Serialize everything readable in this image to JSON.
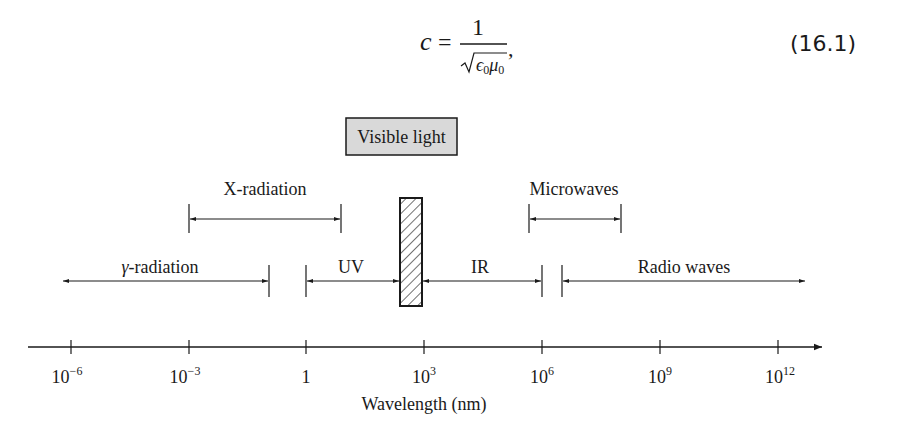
{
  "equation": {
    "lhs": "c",
    "equals": "=",
    "numerator": "1",
    "denominator_symbols": [
      "ϵ",
      "0",
      "μ",
      "0"
    ],
    "trailing": ",",
    "number": "(16.1)"
  },
  "diagram": {
    "visible_light_label": "Visible light",
    "bands": [
      {
        "name": "x-radiation",
        "label": "X-radiation"
      },
      {
        "name": "microwaves",
        "label": "Microwaves"
      },
      {
        "name": "gamma-radiation",
        "label_symbol": "γ",
        "label": "-radiation"
      },
      {
        "name": "uv",
        "label": "UV"
      },
      {
        "name": "ir",
        "label": "IR"
      },
      {
        "name": "radio-waves",
        "label": "Radio waves"
      }
    ],
    "axis": {
      "ticks": [
        {
          "base": "10",
          "exp": "−6"
        },
        {
          "base": "10",
          "exp": "−3"
        },
        {
          "base": "1",
          "exp": ""
        },
        {
          "base": "10",
          "exp": "3"
        },
        {
          "base": "10",
          "exp": "6"
        },
        {
          "base": "10",
          "exp": "9"
        },
        {
          "base": "10",
          "exp": "12"
        }
      ],
      "label": "Wavelength (nm)"
    }
  },
  "colors": {
    "ink": "#1a1a1a",
    "visible_box_fill": "#d9d9d9",
    "hatch_fill": "#ffffff"
  }
}
